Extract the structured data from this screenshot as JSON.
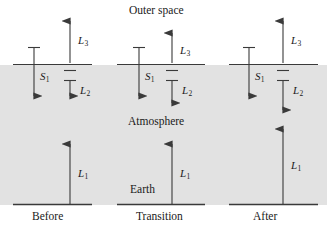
{
  "figure": {
    "background_color": "#ffffff",
    "atmosphere_fill": "#e2e2e2",
    "line_color": "#3a3a3a",
    "text_color": "#1a1a1a",
    "width": 327,
    "height": 235
  },
  "regions": [
    {
      "name": "outer-space",
      "label": "Outer space"
    },
    {
      "name": "atmosphere",
      "label": "Atmosphere"
    },
    {
      "name": "earth",
      "label": "Earth"
    }
  ],
  "region_labels": {
    "outer_space": "Outer space",
    "atmosphere": "Atmosphere",
    "earth": "Earth"
  },
  "panels": [
    {
      "name": "before",
      "label": "Before",
      "fluxes": [
        {
          "symbol": "S",
          "subscript": "1",
          "label": "S1",
          "direction": "down",
          "region": "atmosphere"
        },
        {
          "symbol": "L",
          "subscript": "1",
          "label": "L1",
          "direction": "up",
          "region": "earth-to-atmosphere"
        },
        {
          "symbol": "L",
          "subscript": "2",
          "label": "L2",
          "direction": "down",
          "region": "atmosphere"
        },
        {
          "symbol": "L",
          "subscript": "3",
          "label": "L3",
          "direction": "up",
          "region": "outer-space"
        }
      ]
    },
    {
      "name": "transition",
      "label": "Transition",
      "fluxes": [
        {
          "symbol": "S",
          "subscript": "1",
          "label": "S1",
          "direction": "down",
          "region": "atmosphere"
        },
        {
          "symbol": "L",
          "subscript": "1",
          "label": "L1",
          "direction": "up",
          "region": "earth-to-atmosphere"
        },
        {
          "symbol": "L",
          "subscript": "2",
          "label": "L2",
          "direction": "down",
          "region": "atmosphere"
        },
        {
          "symbol": "L",
          "subscript": "3",
          "label": "L3",
          "direction": "up",
          "region": "outer-space"
        }
      ]
    },
    {
      "name": "after",
      "label": "After",
      "fluxes": [
        {
          "symbol": "S",
          "subscript": "1",
          "label": "S1",
          "direction": "down",
          "region": "atmosphere"
        },
        {
          "symbol": "L",
          "subscript": "1",
          "label": "L1",
          "direction": "up",
          "region": "earth-to-atmosphere"
        },
        {
          "symbol": "L",
          "subscript": "2",
          "label": "L2",
          "direction": "down",
          "region": "atmosphere"
        },
        {
          "symbol": "L",
          "subscript": "3",
          "label": "L3",
          "direction": "up",
          "region": "outer-space"
        }
      ]
    }
  ],
  "panel_labels": {
    "before": "Before",
    "transition": "Transition",
    "after": "After"
  },
  "flux_symbols": {
    "s1_letter": "S",
    "s1_sub": "1",
    "l1_letter": "L",
    "l1_sub": "1",
    "l2_letter": "L",
    "l2_sub": "2",
    "l3_letter": "L",
    "l3_sub": "3"
  }
}
